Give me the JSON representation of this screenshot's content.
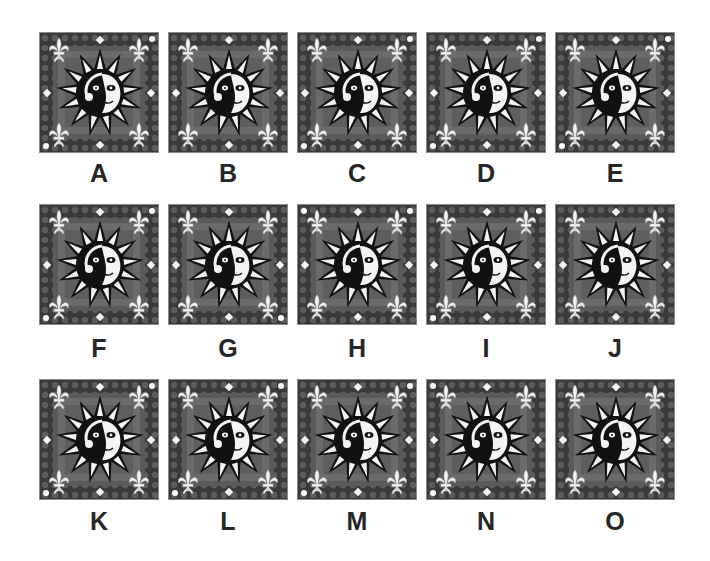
{
  "puzzle": {
    "tile_colors": {
      "outer": "#3a3a3a",
      "pattern": "#5c5c5c",
      "inner": "#6b6b6b",
      "accent": "#ffffff",
      "label": "#262626"
    },
    "tiles": [
      {
        "label": "A",
        "row": 0,
        "col": 0,
        "corner_dots": [
          "tr",
          "bl"
        ]
      },
      {
        "label": "B",
        "row": 0,
        "col": 1,
        "corner_dots": []
      },
      {
        "label": "C",
        "row": 0,
        "col": 2,
        "corner_dots": [
          "tr",
          "bl"
        ]
      },
      {
        "label": "D",
        "row": 0,
        "col": 3,
        "corner_dots": [
          "tr",
          "bl"
        ]
      },
      {
        "label": "E",
        "row": 0,
        "col": 4,
        "corner_dots": [
          "tr",
          "bl"
        ]
      },
      {
        "label": "F",
        "row": 1,
        "col": 0,
        "corner_dots": [
          "tr",
          "bl"
        ]
      },
      {
        "label": "G",
        "row": 1,
        "col": 1,
        "corner_dots": [
          "br"
        ]
      },
      {
        "label": "H",
        "row": 1,
        "col": 2,
        "corner_dots": [
          "tl",
          "tr"
        ]
      },
      {
        "label": "I",
        "row": 1,
        "col": 3,
        "corner_dots": [
          "tr",
          "bl"
        ]
      },
      {
        "label": "J",
        "row": 1,
        "col": 4,
        "corner_dots": []
      },
      {
        "label": "K",
        "row": 2,
        "col": 0,
        "corner_dots": [
          "tr",
          "bl"
        ]
      },
      {
        "label": "L",
        "row": 2,
        "col": 1,
        "corner_dots": [
          "tr",
          "bl"
        ]
      },
      {
        "label": "M",
        "row": 2,
        "col": 2,
        "corner_dots": [
          "tr",
          "bl"
        ]
      },
      {
        "label": "N",
        "row": 2,
        "col": 3,
        "corner_dots": [
          "tl",
          "bl"
        ]
      },
      {
        "label": "O",
        "row": 2,
        "col": 4,
        "corner_dots": []
      }
    ]
  }
}
